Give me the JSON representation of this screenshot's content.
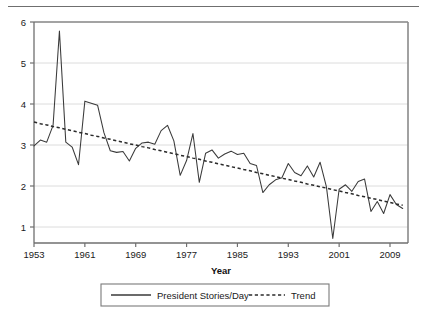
{
  "chart_data": {
    "type": "line",
    "title": "",
    "xlabel": "Year",
    "ylabel": "",
    "xlim": [
      1953,
      2011
    ],
    "ylim": [
      0.55,
      6.15
    ],
    "grid": true,
    "grid_axis": "y",
    "legend_position": "bottom-outside",
    "xticks": [
      1953,
      1961,
      1969,
      1977,
      1985,
      1993,
      2001,
      2009
    ],
    "xticklabels": [
      "1953",
      "1961",
      "1969",
      "1977",
      "1985",
      "1993",
      "2001",
      "2009"
    ],
    "yticks": [
      1,
      2,
      3,
      4,
      5,
      6
    ],
    "yticklabels": [
      "1",
      "2",
      "3",
      "4",
      "5",
      "6"
    ],
    "x": [
      1953,
      1954,
      1955,
      1956,
      1957,
      1958,
      1959,
      1960,
      1961,
      1962,
      1963,
      1964,
      1965,
      1966,
      1967,
      1968,
      1969,
      1970,
      1971,
      1972,
      1973,
      1974,
      1975,
      1976,
      1977,
      1978,
      1979,
      1980,
      1981,
      1982,
      1983,
      1984,
      1985,
      1986,
      1987,
      1988,
      1989,
      1990,
      1991,
      1992,
      1993,
      1994,
      1995,
      1996,
      1997,
      1998,
      1999,
      2000,
      2001,
      2002,
      2003,
      2004,
      2005,
      2006,
      2007,
      2008,
      2009,
      2010,
      2011
    ],
    "series": [
      {
        "name": "President Stories/Day",
        "style": "solid",
        "color": "#3a3a3a",
        "values": [
          2.98,
          3.12,
          3.07,
          3.48,
          5.78,
          3.07,
          2.95,
          2.52,
          4.07,
          4.02,
          3.97,
          3.3,
          2.86,
          2.82,
          2.84,
          2.61,
          2.92,
          3.05,
          3.07,
          3.02,
          3.35,
          3.48,
          3.1,
          2.26,
          2.62,
          3.28,
          2.09,
          2.8,
          2.88,
          2.68,
          2.78,
          2.85,
          2.77,
          2.8,
          2.55,
          2.5,
          1.84,
          2.03,
          2.15,
          2.2,
          2.55,
          2.33,
          2.25,
          2.49,
          2.22,
          2.58,
          1.98,
          0.72,
          1.92,
          2.03,
          1.87,
          2.11,
          2.17,
          1.38,
          1.62,
          1.33,
          1.79,
          1.55,
          1.45
        ]
      },
      {
        "name": "Trend",
        "style": "dashed",
        "color": "#2b2b2b",
        "values": [
          3.56,
          3.52,
          3.49,
          3.45,
          3.42,
          3.38,
          3.35,
          3.31,
          3.28,
          3.24,
          3.21,
          3.17,
          3.14,
          3.1,
          3.07,
          3.03,
          3.0,
          2.96,
          2.93,
          2.89,
          2.86,
          2.82,
          2.79,
          2.75,
          2.72,
          2.68,
          2.65,
          2.61,
          2.58,
          2.54,
          2.51,
          2.47,
          2.44,
          2.4,
          2.37,
          2.33,
          2.3,
          2.26,
          2.23,
          2.19,
          2.16,
          2.12,
          2.09,
          2.05,
          2.02,
          1.98,
          1.95,
          1.91,
          1.88,
          1.84,
          1.81,
          1.77,
          1.74,
          1.7,
          1.67,
          1.63,
          1.6,
          1.56,
          1.53
        ]
      }
    ],
    "legend_entries": [
      {
        "label": "President Stories/Day",
        "style": "solid"
      },
      {
        "label": "Trend",
        "style": "dashed"
      }
    ]
  },
  "colors": {
    "axis": "#6f6f6f",
    "grid": "#d8d8d8",
    "series": "#3a3a3a",
    "trend": "#2b2b2b",
    "text": "#1a1a1a",
    "background": "#ffffff"
  }
}
